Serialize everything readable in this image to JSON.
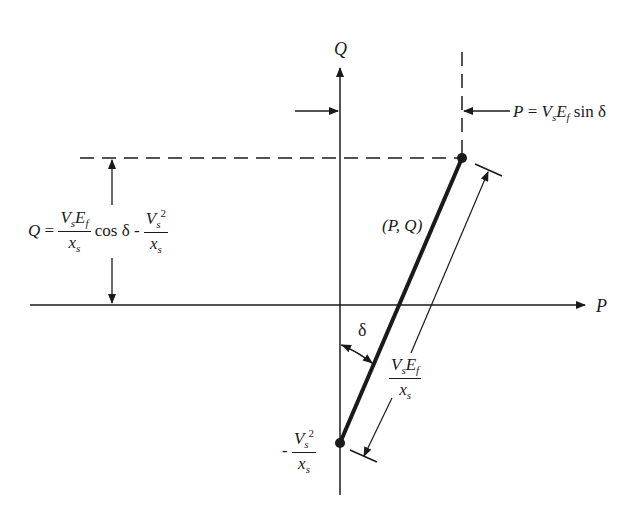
{
  "diagram": {
    "axes": {
      "horizontal_label": "P",
      "vertical_label": "Q"
    },
    "point_label": "(P, Q)",
    "angle_label": "δ",
    "p_equation": {
      "lhs": "P",
      "eq": "=",
      "v": "V",
      "v_sub": "s",
      "e": "E",
      "e_sub": "f",
      "func": "sin",
      "angle": "δ"
    },
    "q_equation": {
      "lhs": "Q",
      "eq": "=",
      "num1_v": "V",
      "num1_v_sub": "s",
      "num1_e": "E",
      "num1_e_sub": "f",
      "den1": "x",
      "den1_sub": "s",
      "func": "cos",
      "angle": "δ",
      "minus": "-",
      "num2_v": "V",
      "num2_v_sub": "s",
      "num2_sup": "2",
      "den2": "x",
      "den2_sub": "s"
    },
    "segment_length_label": {
      "v": "V",
      "v_sub": "s",
      "e": "E",
      "e_sub": "f",
      "den": "x",
      "den_sub": "s"
    },
    "offset_label": {
      "minus": "-",
      "v": "V",
      "v_sub": "s",
      "sup": "2",
      "den": "x",
      "den_sub": "s"
    },
    "colors": {
      "ink": "#1a1a1a",
      "background": "#ffffff"
    }
  }
}
